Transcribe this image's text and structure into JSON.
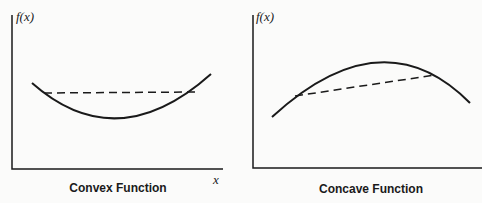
{
  "left": {
    "y_label": "f(x)",
    "x_label": "x",
    "caption": "Convex Function"
  },
  "right": {
    "y_label": "f(x)",
    "caption": "Concave Function"
  }
}
